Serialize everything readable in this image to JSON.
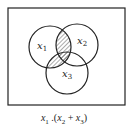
{
  "diagram": {
    "type": "venn",
    "sets": [
      {
        "name": "x1",
        "base": "x",
        "sub": "1"
      },
      {
        "name": "x2",
        "base": "x",
        "sub": "2"
      },
      {
        "name": "x3",
        "base": "x",
        "sub": "3"
      }
    ],
    "shaded_region": "x1 ∩ (x2 ∪ x3)",
    "caption": "x1 .(x2 + x3)",
    "colors": {
      "stroke": "#222222",
      "background": "#ffffff",
      "hatch": "#444444"
    }
  },
  "labels": {
    "x1_base": "x",
    "x1_sub": "1",
    "x2_base": "x",
    "x2_sub": "2",
    "x3_base": "x",
    "x3_sub": "3"
  },
  "caption": {
    "x1": "x",
    "s1": "1",
    "dot": " .(",
    "x2": "x",
    "s2": "2",
    "plus": " + ",
    "x3": "x",
    "s3": "3",
    "close": ")"
  }
}
